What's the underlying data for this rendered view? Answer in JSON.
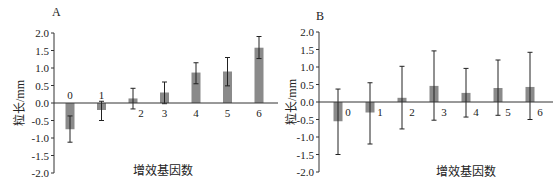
{
  "chart_data": [
    {
      "type": "bar",
      "panel": "A",
      "title": "",
      "xlabel": "增效基因数",
      "ylabel": "粒长/mm",
      "categories": [
        "0",
        "1",
        "2",
        "3",
        "4",
        "5",
        "6"
      ],
      "values": [
        -0.75,
        -0.2,
        0.13,
        0.3,
        0.87,
        0.9,
        1.58
      ],
      "error_low": [
        -1.12,
        -0.5,
        -0.17,
        -0.02,
        0.55,
        0.49,
        1.27
      ],
      "error_high": [
        -0.37,
        0.05,
        0.42,
        0.6,
        1.15,
        1.3,
        1.9
      ],
      "yticks": [
        "2.0",
        "1.5",
        "1.0",
        "0.5",
        "0.0",
        "-0.5",
        "-1.0",
        "-1.5",
        "-2.0"
      ],
      "ylim": [
        -2.0,
        2.0
      ],
      "grid": false,
      "legend": null
    },
    {
      "type": "bar",
      "panel": "B",
      "title": "",
      "xlabel": "增效基因数",
      "ylabel": "粒长/mm",
      "categories": [
        "0",
        "1",
        "2",
        "3",
        "4",
        "5",
        "6"
      ],
      "values": [
        -0.55,
        -0.3,
        0.12,
        0.46,
        0.26,
        0.4,
        0.43
      ],
      "error_low": [
        -1.5,
        -1.2,
        -0.77,
        -0.52,
        -0.43,
        -0.38,
        -0.5
      ],
      "error_high": [
        0.37,
        0.55,
        1.02,
        1.46,
        0.96,
        1.2,
        1.42
      ],
      "yticks": [
        "2.0",
        "1.5",
        "1.0",
        "0.5",
        "0.0",
        "-0.5",
        "-1.0",
        "-1.5",
        "-2.0"
      ],
      "ylim": [
        -2.0,
        2.0
      ],
      "grid": false,
      "legend": null
    }
  ],
  "panels": {
    "a": {
      "label": "A",
      "xlabel": "增效基因数",
      "ylabel": "粒长/mm"
    },
    "b": {
      "label": "B",
      "xlabel": "增效基因数",
      "ylabel": "粒长/mm"
    }
  },
  "colors": {
    "bar": "#8a8a8a",
    "axis": "#333333",
    "error": "#222222"
  }
}
